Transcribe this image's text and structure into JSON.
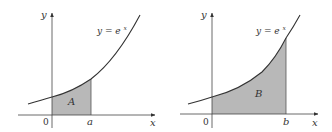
{
  "panels": [
    {
      "id": "left",
      "function_label": "y = e",
      "function_exp": "x",
      "region_label": "A",
      "x_axis_label": "x",
      "y_axis_label": "y",
      "origin_label": "0",
      "bound_label": "a"
    },
    {
      "id": "right",
      "function_label": "y = e",
      "function_exp": "x",
      "region_label": "B",
      "x_axis_label": "x",
      "y_axis_label": "y",
      "origin_label": "0",
      "bound_label": "b"
    }
  ],
  "colors": {
    "curve": "#333333",
    "fill": "#b8b8b8",
    "axis": "#444444"
  }
}
